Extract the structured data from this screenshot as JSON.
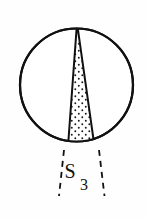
{
  "figure": {
    "domain": "Diagram",
    "title": "",
    "background_color": "#fefefe",
    "stroke_color": "#111111",
    "fill_color": "#ffffff",
    "stipple_color": "#1a1a1a",
    "width": 147,
    "height": 219,
    "label": {
      "base": "S",
      "subscript": "3",
      "full": "S3",
      "x": 76,
      "y": 176
    },
    "circle": {
      "center_x": 76.5,
      "center_y": 85.0,
      "radius": 56.5,
      "stroke_width": 2.2
    },
    "wedge": {
      "apex_x": 77.0,
      "apex_y": 23.0,
      "base_left_x": 67.5,
      "base_right_x": 95.5,
      "base_y": 147.5,
      "stroke_width": 2.0,
      "stipple_dot_radius": 0.95,
      "stipple_spacing_x": 7.0,
      "stipple_spacing_y": 7.0
    },
    "dashed_lines": [
      {
        "name": "left-extension",
        "x1": 64.0,
        "y1": 150.0,
        "x2": 59.0,
        "y2": 196.0
      },
      {
        "name": "right-extension",
        "x1": 99.0,
        "y1": 150.0,
        "x2": 104.5,
        "y2": 196.0
      }
    ],
    "dash_pattern": "6 5",
    "dash_stroke_width": 1.8
  }
}
